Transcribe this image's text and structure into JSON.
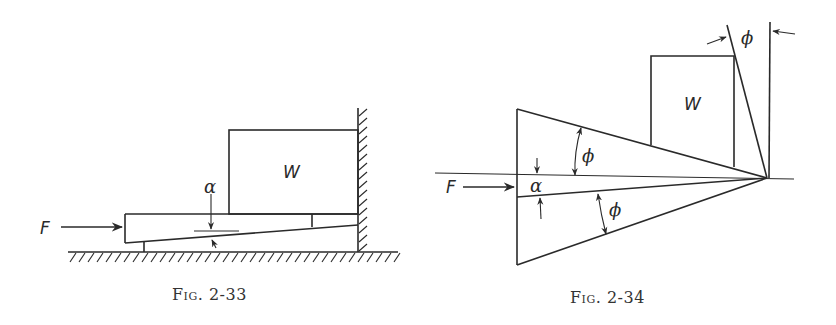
{
  "figures": [
    {
      "id": "fig-2-33",
      "caption": "Fig. 2-33",
      "labels": {
        "force": "F",
        "weight": "W",
        "angle": "α"
      }
    },
    {
      "id": "fig-2-34",
      "caption": "Fig. 2-34",
      "labels": {
        "force": "F",
        "weight": "W",
        "angle": "α",
        "friction_angle_upper": "ϕ",
        "friction_angle_lower": "ϕ",
        "friction_angle_top": "ϕ"
      }
    }
  ],
  "colors": {
    "ink": "#2a2a2a",
    "background": "#ffffff"
  }
}
